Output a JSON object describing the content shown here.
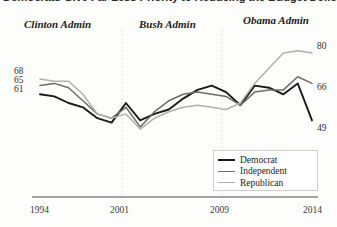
{
  "title": "Democrats Give Far Less Priority to Reducing the Budget Deficit",
  "eras": [
    {
      "label": "Clinton Admin"
    },
    {
      "label": "Bush Admin"
    },
    {
      "label": "Obama Admin"
    }
  ],
  "legend": {
    "items": [
      {
        "label": "Democrat",
        "color": "#1a1a1a"
      },
      {
        "label": "Independent",
        "color": "#6b6b6b"
      },
      {
        "label": "Republican",
        "color": "#b0b0b0"
      }
    ]
  },
  "chart_data": {
    "type": "line",
    "title": "Democrats Give Far Less Priority to Reducing the Budget Deficit",
    "xlabel": "",
    "ylabel": "",
    "grid": false,
    "legend_position": "inside-bottom-right",
    "xlim": [
      1994,
      2014
    ],
    "ylim": [
      40,
      85
    ],
    "xticks": [
      "1994",
      "2001",
      "2009",
      "2014"
    ],
    "vertical_markers": [
      2001,
      2009
    ],
    "endpoint_labels_left": [
      "68",
      "65",
      "61"
    ],
    "endpoint_labels_right": [
      "80",
      "66",
      "49"
    ],
    "x": [
      1994,
      1995,
      1996,
      1997,
      1998,
      1999,
      2001,
      2002,
      2003,
      2004,
      2005,
      2006,
      2007,
      2008,
      2009,
      2010,
      2011,
      2012,
      2013,
      2014
    ],
    "series": [
      {
        "name": "Democrat",
        "color": "#1a1a1a",
        "start_value": 61,
        "end_value": 49,
        "values": [
          61,
          60,
          57,
          55,
          50,
          48,
          57,
          49,
          52,
          54,
          59,
          63,
          65,
          62,
          56,
          65,
          64,
          61,
          66,
          49
        ]
      },
      {
        "name": "Independent",
        "color": "#6b6b6b",
        "start_value": 65,
        "end_value": 66,
        "values": [
          65,
          66,
          64,
          58,
          52,
          50,
          55,
          46,
          53,
          58,
          61,
          62,
          61,
          60,
          56,
          62,
          63,
          63,
          69,
          66
        ]
      },
      {
        "name": "Republican",
        "color": "#b0b0b0",
        "start_value": 68,
        "end_value": 80,
        "values": [
          68,
          67,
          67,
          61,
          52,
          50,
          52,
          45,
          50,
          53,
          55,
          56,
          55,
          54,
          57,
          66,
          73,
          80,
          81,
          80
        ]
      }
    ]
  }
}
